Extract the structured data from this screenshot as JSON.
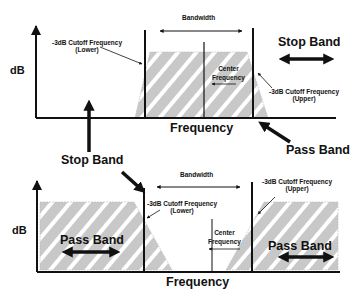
{
  "top_diagram": {
    "title": "Band-pass filter response",
    "y_axis_label": "dB",
    "x_axis_label": "Frequency",
    "bandwidth_label": "Bandwidth",
    "lower_cutoff_label_line1": "-3dB Cutoff Frequency",
    "lower_cutoff_label_line2": "(Lower)",
    "upper_cutoff_label_line1": "-3dB Cutoff Frequency",
    "upper_cutoff_label_line2": "(Upper)",
    "center_label_line1": "Center",
    "center_label_line2": "Frequency",
    "stop_band_label": "Stop Band",
    "pass_band_label": "Pass Band"
  },
  "middle": {
    "stop_band_label": "Stop Band"
  },
  "bottom_diagram": {
    "title": "Band-stop filter response",
    "y_axis_label": "dB",
    "x_axis_label": "Frequency",
    "bandwidth_label": "Bandwidth",
    "lower_cutoff_label_line1": "-3dB Cutoff Frequency",
    "lower_cutoff_label_line2": "(Lower)",
    "upper_cutoff_label_line1": "-3dB Cutoff Frequency",
    "upper_cutoff_label_line2": "(Upper)",
    "center_label_line1": "Center",
    "center_label_line2": "Frequency",
    "pass_band_left_label": "Pass Band",
    "pass_band_right_label": "Pass Band"
  },
  "colors": {
    "line": "#111111",
    "fill": "#c8c8c8",
    "hatch": "#ffffff",
    "background": "#ffffff"
  }
}
